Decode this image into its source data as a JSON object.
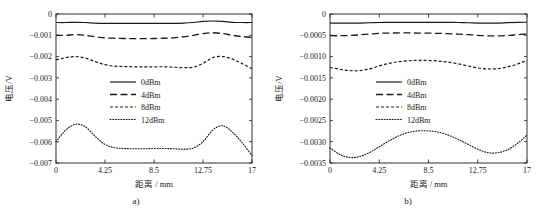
{
  "figure": {
    "panels": [
      {
        "caption": "a)",
        "xlabel": "距离 / mm",
        "ylabel": "电压/V"
      },
      {
        "caption": "b)",
        "xlabel": "距离 / mm",
        "ylabel": "电压/V"
      }
    ]
  },
  "chart_data": [
    {
      "type": "line",
      "title": "",
      "panel_label": "a)",
      "xlabel": "距离 / mm",
      "ylabel": "电压/V",
      "xlim": [
        0,
        17
      ],
      "ylim": [
        -0.007,
        0
      ],
      "xticks": [
        0,
        4.25,
        8.5,
        12.75,
        17
      ],
      "xtick_labels": [
        "0",
        "4.25",
        "8.5",
        "12.75",
        "17"
      ],
      "yticks": [
        0,
        -0.001,
        -0.002,
        -0.003,
        -0.004,
        -0.005,
        -0.006,
        -0.007
      ],
      "ytick_labels": [
        "0",
        "-0.001",
        "-0.002",
        "-0.003",
        "-0.004",
        "-0.005",
        "-0.006",
        "-0.007"
      ],
      "grid": false,
      "legend_position": "center",
      "x": [
        0,
        0.85,
        1.7,
        2.55,
        3.4,
        4.25,
        5.1,
        5.95,
        6.8,
        7.65,
        8.5,
        9.35,
        10.2,
        11.05,
        11.9,
        12.75,
        13.6,
        14.45,
        15.3,
        16.15,
        17
      ],
      "series": [
        {
          "name": "0dBm",
          "style": "solid",
          "values": [
            -0.0004,
            -0.0004,
            -0.00039,
            -0.0004,
            -0.00043,
            -0.00044,
            -0.00044,
            -0.00044,
            -0.00044,
            -0.00044,
            -0.00044,
            -0.00044,
            -0.00044,
            -0.00043,
            -0.0004,
            -0.00035,
            -0.00033,
            -0.00035,
            -0.00039,
            -0.0004,
            -0.0004
          ]
        },
        {
          "name": "4dBm",
          "style": "dashed",
          "values": [
            -0.001,
            -0.001,
            -0.00097,
            -0.001,
            -0.00107,
            -0.00112,
            -0.00114,
            -0.00115,
            -0.00116,
            -0.00116,
            -0.00115,
            -0.00114,
            -0.00112,
            -0.00107,
            -0.001,
            -0.00092,
            -0.00088,
            -0.00092,
            -0.001,
            -0.00106,
            -0.0011
          ]
        },
        {
          "name": "8dBm",
          "style": "dashdot",
          "values": [
            -0.00215,
            -0.00205,
            -0.002,
            -0.00207,
            -0.00224,
            -0.00238,
            -0.00245,
            -0.00247,
            -0.00248,
            -0.00248,
            -0.00248,
            -0.00248,
            -0.0025,
            -0.00252,
            -0.0025,
            -0.00232,
            -0.00205,
            -0.002,
            -0.00212,
            -0.00233,
            -0.00257
          ]
        },
        {
          "name": "12dBm",
          "style": "dotted",
          "values": [
            -0.006,
            -0.00545,
            -0.00518,
            -0.0053,
            -0.00575,
            -0.00613,
            -0.00628,
            -0.00632,
            -0.00633,
            -0.00633,
            -0.00632,
            -0.00632,
            -0.00633,
            -0.00635,
            -0.0063,
            -0.006,
            -0.00545,
            -0.00525,
            -0.00555,
            -0.00605,
            -0.00665
          ]
        }
      ]
    },
    {
      "type": "line",
      "title": "",
      "panel_label": "b)",
      "xlabel": "距离 / mm",
      "ylabel": "电压/V",
      "xlim": [
        0,
        17
      ],
      "ylim": [
        -0.0035,
        0
      ],
      "xticks": [
        0,
        4.25,
        8.5,
        12.75,
        17
      ],
      "xtick_labels": [
        "0",
        "4.25",
        "8.5",
        "12.75",
        "17"
      ],
      "yticks": [
        0,
        -0.0005,
        -0.001,
        -0.0015,
        -0.002,
        -0.0025,
        -0.003,
        -0.0035
      ],
      "ytick_labels": [
        "0",
        "-0.0005",
        "-0.0010",
        "-0.0015",
        "-0.0020",
        "-0.0025",
        "-0.0030",
        "-0.0035"
      ],
      "grid": false,
      "legend_position": "center",
      "x": [
        0,
        0.85,
        1.7,
        2.55,
        3.4,
        4.25,
        5.1,
        5.95,
        6.8,
        7.65,
        8.5,
        9.35,
        10.2,
        11.05,
        11.9,
        12.75,
        13.6,
        14.45,
        15.3,
        16.15,
        17
      ],
      "series": [
        {
          "name": "0dBm",
          "style": "solid",
          "values": [
            -0.000215,
            -0.000215,
            -0.000215,
            -0.000213,
            -0.000205,
            -0.0002,
            -0.000198,
            -0.000197,
            -0.000197,
            -0.000197,
            -0.000197,
            -0.000197,
            -0.000198,
            -0.0002,
            -0.000205,
            -0.000212,
            -0.000215,
            -0.000213,
            -0.000203,
            -0.000195,
            -0.000193
          ]
        },
        {
          "name": "4dBm",
          "style": "dashed",
          "values": [
            -0.00051,
            -0.00051,
            -0.000505,
            -0.00049,
            -0.00047,
            -0.000455,
            -0.000448,
            -0.000445,
            -0.000445,
            -0.000447,
            -0.00045,
            -0.000455,
            -0.000462,
            -0.000472,
            -0.000485,
            -0.0005,
            -0.000512,
            -0.000515,
            -0.000505,
            -0.000487,
            -0.000468
          ]
        },
        {
          "name": "8dBm",
          "style": "dashdot",
          "values": [
            -0.001255,
            -0.0013,
            -0.00133,
            -0.00133,
            -0.00129,
            -0.00122,
            -0.00116,
            -0.00112,
            -0.001098,
            -0.00109,
            -0.001092,
            -0.001105,
            -0.00113,
            -0.00117,
            -0.00122,
            -0.001268,
            -0.00129,
            -0.001285,
            -0.001245,
            -0.00118,
            -0.00109
          ]
        },
        {
          "name": "12dBm",
          "style": "dotted",
          "values": [
            -0.003145,
            -0.0033,
            -0.00337,
            -0.00335,
            -0.003255,
            -0.00312,
            -0.00298,
            -0.00286,
            -0.00278,
            -0.002745,
            -0.002745,
            -0.002775,
            -0.002845,
            -0.002945,
            -0.00306,
            -0.003175,
            -0.003255,
            -0.00326,
            -0.00319,
            -0.003045,
            -0.002845
          ]
        }
      ]
    }
  ]
}
